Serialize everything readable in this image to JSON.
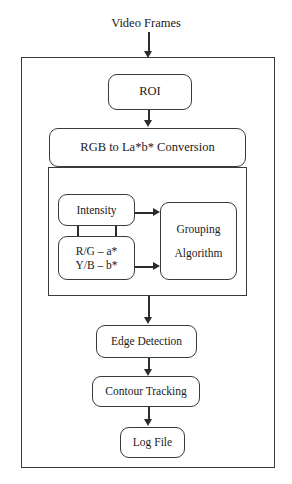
{
  "diagram": {
    "title_caption": "Video Frames",
    "outer_block_label": "processing-pipeline",
    "nodes": {
      "roi": "ROI",
      "rgb_conversion": "RGB to La*b* Conversion",
      "intensity": "Intensity",
      "chroma_line1": "R/G – a*",
      "chroma_line2": "Y/B – b*",
      "grouping_line1": "Grouping",
      "grouping_line2": "Algorithm",
      "edge_detection": "Edge Detection",
      "contour_tracking": "Contour Tracking",
      "log_file": "Log File"
    },
    "colors": {
      "stroke": "#3a3a3a",
      "connector": "#2b2b2b",
      "text": "#1a1a1a",
      "background": "#ffffff"
    }
  }
}
